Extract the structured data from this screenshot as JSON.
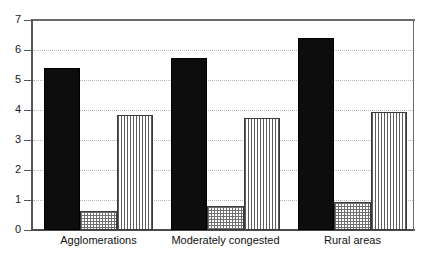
{
  "chart_data": {
    "type": "bar",
    "title": "",
    "subtitle": "",
    "xlabel": "",
    "ylabel": "",
    "categories": [
      "Agglomerations",
      "Moderately congested",
      "Rural areas"
    ],
    "series": [
      {
        "name": "series-1-solid-black",
        "pattern": "solid-black",
        "values": [
          5.4,
          5.72,
          6.4
        ]
      },
      {
        "name": "series-2-cross-hatch",
        "pattern": "cross-hatch",
        "values": [
          0.65,
          0.8,
          0.93
        ]
      },
      {
        "name": "series-3-vertical-lines",
        "pattern": "vertical-lines",
        "values": [
          3.85,
          3.73,
          3.93
        ]
      }
    ],
    "ylim": [
      0,
      7
    ],
    "ytick_labels": [
      "0",
      "1",
      "2",
      "3",
      "4",
      "5",
      "6",
      "7"
    ],
    "ytick_values": [
      0,
      1,
      2,
      3,
      4,
      5,
      6,
      7
    ],
    "grid": true,
    "grid_style": "dotted-horizontal",
    "legend": "none",
    "legend_position": "none",
    "annotations": [],
    "colors": {
      "series_1": "#0d0d0d",
      "series_2": "#ffffff",
      "series_3": "#ffffff",
      "axis": "#4a4a4a",
      "grid": "#b8b8b8",
      "background": "#ffffff",
      "text": "#101010"
    }
  }
}
